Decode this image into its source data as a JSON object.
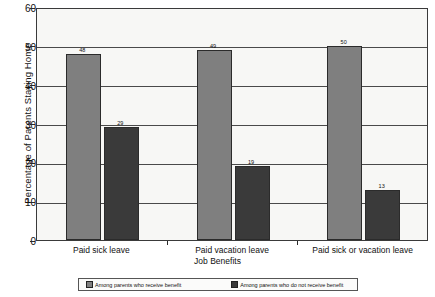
{
  "chart_data": {
    "type": "bar",
    "title": "",
    "xlabel": "Job Benefits",
    "ylabel": "Percentage of Parents Staying Home",
    "categories": [
      "Paid sick leave",
      "Paid vacation leave",
      "Paid sick or vacation leave"
    ],
    "series": [
      {
        "name": "Among parents who receive benefit",
        "color": "#7f7f7f",
        "values": [
          48,
          49,
          50
        ]
      },
      {
        "name": "Among parents who do not receive benefit",
        "color": "#3a3a3a",
        "values": [
          29,
          19,
          13
        ]
      }
    ],
    "ylim": [
      0,
      60
    ],
    "yticks": [
      0,
      10,
      20,
      30,
      40,
      50,
      60
    ],
    "ytick_labels": [
      "0",
      "10",
      "20",
      "30",
      "40",
      "50",
      "60"
    ],
    "grid": true,
    "legend_position": "bottom",
    "data_labels": true
  },
  "legend": {
    "entries": [
      "Among parents who receive benefit",
      "Among parents who do not receive benefit"
    ]
  }
}
